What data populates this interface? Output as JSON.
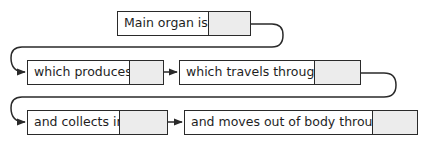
{
  "diagram": {
    "type": "flow-chain",
    "colors": {
      "line": "#2a2a2a",
      "answer_fill": "#ececec",
      "box_fill": "#ffffff"
    },
    "steps": [
      {
        "label": "Main organ is:",
        "answer": ""
      },
      {
        "label": "which produces:",
        "answer": ""
      },
      {
        "label": "which travels through:",
        "answer": ""
      },
      {
        "label": "and collects in:",
        "answer": ""
      },
      {
        "label": "and moves out of body through:",
        "answer": ""
      }
    ],
    "connections": [
      {
        "from": 0,
        "to": 1,
        "style": "wrap-arrow"
      },
      {
        "from": 1,
        "to": 2,
        "style": "arrow"
      },
      {
        "from": 2,
        "to": 3,
        "style": "wrap-arrow"
      },
      {
        "from": 3,
        "to": 4,
        "style": "arrow"
      }
    ]
  }
}
